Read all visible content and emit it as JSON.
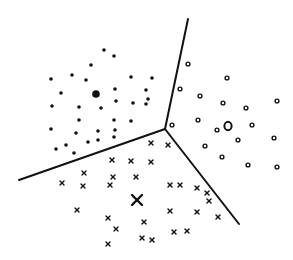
{
  "diagram": {
    "title": "Voronoi partition of three clusters",
    "width": 293,
    "height": 260,
    "colors": {
      "ink": "#111111",
      "background": "#ffffff"
    },
    "boundaries": {
      "junction": [
        165,
        129
      ],
      "lines": [
        {
          "name": "boundary-top",
          "from": [
            165,
            129
          ],
          "to": [
            188,
            19
          ]
        },
        {
          "name": "boundary-left",
          "from": [
            165,
            129
          ],
          "to": [
            19,
            180
          ]
        },
        {
          "name": "boundary-right",
          "from": [
            165,
            129
          ],
          "to": [
            239,
            224
          ]
        }
      ]
    },
    "clusters": [
      {
        "name": "dots",
        "marker": "dot",
        "centroid": [
          96,
          94
        ],
        "points": [
          [
            104,
            50
          ],
          [
            114,
            56
          ],
          [
            91,
            65
          ],
          [
            51,
            79
          ],
          [
            72,
            75
          ],
          [
            86,
            80
          ],
          [
            131,
            77
          ],
          [
            152,
            78
          ],
          [
            61,
            93
          ],
          [
            115,
            89
          ],
          [
            146,
            90
          ],
          [
            116,
            101
          ],
          [
            52,
            106
          ],
          [
            79,
            107
          ],
          [
            101,
            108
          ],
          [
            133,
            103
          ],
          [
            148,
            99
          ],
          [
            146,
            104
          ],
          [
            79,
            120
          ],
          [
            114,
            120
          ],
          [
            131,
            121
          ],
          [
            51,
            129
          ],
          [
            76,
            133
          ],
          [
            98,
            131
          ],
          [
            115,
            130
          ],
          [
            66,
            145
          ],
          [
            56,
            149
          ],
          [
            74,
            153
          ],
          [
            88,
            142
          ],
          [
            98,
            140
          ],
          [
            114,
            137
          ]
        ]
      },
      {
        "name": "circles",
        "marker": "circle",
        "centroid": [
          228,
          126
        ],
        "points": [
          [
            188,
            64
          ],
          [
            227,
            78
          ],
          [
            180,
            89
          ],
          [
            200,
            96
          ],
          [
            223,
            103
          ],
          [
            277,
            101
          ],
          [
            246,
            108
          ],
          [
            198,
            120
          ],
          [
            172,
            125
          ],
          [
            217,
            130
          ],
          [
            252,
            125
          ],
          [
            238,
            140
          ],
          [
            274,
            138
          ],
          [
            205,
            146
          ],
          [
            222,
            157
          ],
          [
            248,
            165
          ],
          [
            277,
            167
          ]
        ]
      },
      {
        "name": "crosses",
        "marker": "x",
        "centroid": [
          137,
          200
        ],
        "points": [
          [
            151,
            143
          ],
          [
            168,
            145
          ],
          [
            112,
            160
          ],
          [
            131,
            161
          ],
          [
            151,
            162
          ],
          [
            84,
            173
          ],
          [
            136,
            177
          ],
          [
            113,
            177
          ],
          [
            62,
            183
          ],
          [
            83,
            186
          ],
          [
            110,
            185
          ],
          [
            170,
            185
          ],
          [
            180,
            185
          ],
          [
            197,
            188
          ],
          [
            207,
            193
          ],
          [
            209,
            201
          ],
          [
            170,
            211
          ],
          [
            197,
            212
          ],
          [
            218,
            217
          ],
          [
            77,
            210
          ],
          [
            108,
            218
          ],
          [
            144,
            222
          ],
          [
            116,
            229
          ],
          [
            187,
            231
          ],
          [
            174,
            232
          ],
          [
            142,
            238
          ],
          [
            152,
            240
          ],
          [
            108,
            244
          ]
        ]
      }
    ]
  }
}
